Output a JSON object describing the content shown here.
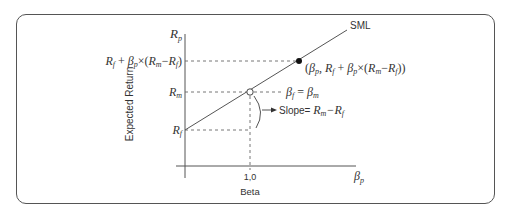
{
  "diagram": {
    "line_label": "SML",
    "y_axis": {
      "symbol": "R",
      "symbol_sub": "p",
      "label": "Expected Return",
      "ticks": {
        "rf": {
          "main": "R",
          "sub": "f"
        },
        "rm": {
          "main": "R",
          "sub": "m"
        },
        "portfolio": {
          "text": "R_f + β_p×(R_m−R_f)"
        }
      }
    },
    "x_axis": {
      "symbol": "β",
      "symbol_sub": "p",
      "label": "Beta",
      "tick_value": "1.0",
      "tick_display": "1,0"
    },
    "annotations": {
      "market_point": "β_f = β_m",
      "slope": "Slope= R_m−R_f",
      "portfolio_point": "(β_p, R_f + β_p×(R_m−R_f))"
    },
    "colors": {
      "line": "#555555",
      "text": "#333333",
      "frame": "#555555"
    }
  }
}
